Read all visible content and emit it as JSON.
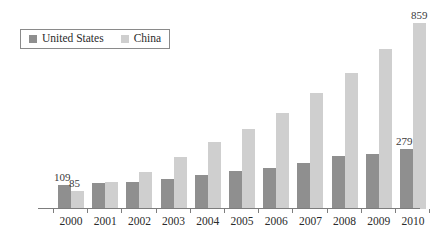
{
  "legend": {
    "position": "top-left",
    "entries": [
      {
        "label": "United States",
        "color": "#8f8f8f",
        "icon": "square-swatch-icon"
      },
      {
        "label": "China",
        "color": "#cfcfcf",
        "icon": "square-swatch-icon"
      }
    ]
  },
  "colors": {
    "united_states": "#8f8f8f",
    "china": "#cfcfcf",
    "axis": "#7d7d7d",
    "text": "#2b2b2b",
    "background": "#ffffff"
  },
  "chart_data": {
    "type": "bar",
    "title": "",
    "subtitle": "",
    "xlabel": "",
    "ylabel": "",
    "grid": false,
    "legend_position": "top-left",
    "ylim": [
      0,
      900
    ],
    "categories": [
      "2000",
      "2001",
      "2002",
      "2003",
      "2004",
      "2005",
      "2006",
      "2007",
      "2008",
      "2009",
      "2010"
    ],
    "series": [
      {
        "name": "United States",
        "color": "#8f8f8f",
        "values": [
          109,
          120,
          125,
          139,
          158,
          176,
          191,
          213,
          245,
          255,
          279
        ]
      },
      {
        "name": "China",
        "color": "#cfcfcf",
        "values": [
          85,
          125,
          172,
          241,
          310,
          370,
          443,
          536,
          628,
          741,
          859
        ]
      }
    ],
    "annotations": [
      {
        "text": "109",
        "series": "United States",
        "category": "2000"
      },
      {
        "text": "85",
        "series": "China",
        "category": "2000"
      },
      {
        "text": "279",
        "series": "United States",
        "category": "2010"
      },
      {
        "text": "859",
        "series": "China",
        "category": "2010"
      }
    ]
  }
}
